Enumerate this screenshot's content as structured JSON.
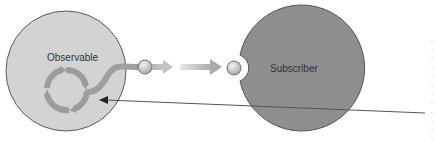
{
  "diagram": {
    "nodes": [
      {
        "id": "observable",
        "label": "Observable",
        "color": "#d2d2d2"
      },
      {
        "id": "subscriber",
        "label": "Subscriber",
        "color": "#8f8f8f"
      }
    ],
    "colors": {
      "stroke": "#555555",
      "stream": "#a8a8a8",
      "pointer_line": "#555555"
    }
  }
}
